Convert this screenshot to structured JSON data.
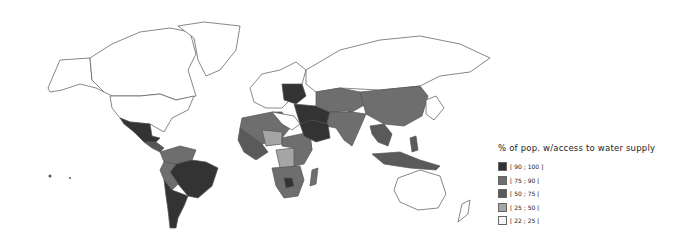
{
  "map": {
    "type": "choropleth world map",
    "metric": "% of pop. w/access to water supply"
  },
  "legend": {
    "title": "% of pop. w/access to water supply",
    "items": [
      {
        "label": "[ 90 ; 100 ]",
        "color": "#333333"
      },
      {
        "label": "[ 75 ; 90 [",
        "color": "#6e6e6e"
      },
      {
        "label": "[ 50 ; 75 [",
        "color": "#5a5a5a"
      },
      {
        "label": "[ 25 ; 50 [",
        "color": "#a5a5a5"
      },
      {
        "label": "[ 22 ; 25 [",
        "color": "#f5f5f5"
      }
    ]
  },
  "colors": {
    "no_data": "#ffffff",
    "c90": "#333333",
    "c75": "#6e6e6e",
    "c50": "#5a5a5a",
    "c25": "#a5a5a5",
    "c22": "#f5f5f5"
  }
}
